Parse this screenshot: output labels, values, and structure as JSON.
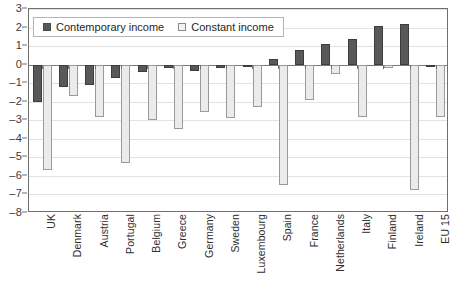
{
  "chart_data": {
    "type": "bar",
    "title": "",
    "subtitle": "",
    "xlabel": "",
    "ylabel": "",
    "ylim": [
      -8,
      3
    ],
    "yticks": [
      3,
      2,
      1,
      0,
      -1,
      -2,
      -3,
      -4,
      -5,
      -6,
      -7,
      -8
    ],
    "ytick_labels": [
      "3",
      "2",
      "1",
      "0",
      "–1",
      "–2",
      "–3",
      "–4",
      "–5",
      "–6",
      "–7",
      "–8"
    ],
    "grid": true,
    "legend_position": "top-left",
    "categories": [
      "UK",
      "Denmark",
      "Austria",
      "Portugal",
      "Belgium",
      "Greece",
      "Germany",
      "Sweden",
      "Luxembourg",
      "Spain",
      "France",
      "Netherlands",
      "Italy",
      "Finland",
      "Ireland",
      "EU 15"
    ],
    "series": [
      {
        "name": "Contemporary income",
        "color": "#585858",
        "values": [
          -2.0,
          -1.2,
          -1.1,
          -0.7,
          -0.4,
          -0.2,
          -0.35,
          -0.2,
          0.0,
          0.3,
          0.8,
          1.1,
          1.4,
          2.1,
          2.2,
          0.0
        ]
      },
      {
        "name": "Constant income",
        "color": "#ebebe9",
        "values": [
          -5.7,
          -1.7,
          -2.8,
          -5.3,
          -3.0,
          -3.45,
          -2.55,
          -2.9,
          -2.3,
          -6.5,
          -1.9,
          -0.5,
          -2.8,
          -0.2,
          -6.75,
          -2.8
        ]
      }
    ]
  },
  "legend": {
    "entries": [
      {
        "label": "Contemporary income"
      },
      {
        "label": "Constant income"
      }
    ]
  }
}
